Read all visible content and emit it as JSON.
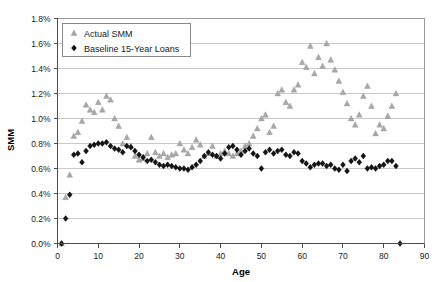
{
  "chart_data": {
    "type": "scatter",
    "title": "",
    "xlabel": "Age",
    "ylabel": "SMM",
    "xlim": [
      0,
      90
    ],
    "ylim": [
      0,
      1.8
    ],
    "grid": true,
    "legend_position": "top-left",
    "x_ticks": [
      "0",
      "10",
      "20",
      "30",
      "40",
      "50",
      "60",
      "70",
      "80",
      "90"
    ],
    "x_tick_values": [
      0,
      10,
      20,
      30,
      40,
      50,
      60,
      70,
      80,
      90
    ],
    "y_ticks": [
      "0.0%",
      "0.2%",
      "0.4%",
      "0.6%",
      "0.8%",
      "1.0%",
      "1.2%",
      "1.4%",
      "1.6%",
      "1.8%"
    ],
    "y_tick_values": [
      0.0,
      0.2,
      0.4,
      0.6,
      0.8,
      1.0,
      1.2,
      1.4,
      1.6,
      1.8
    ],
    "series": [
      {
        "name": "Actual SMM",
        "marker": "triangle",
        "color": "#a9a9a9",
        "x": [
          1,
          2,
          3,
          4,
          5,
          6,
          7,
          8,
          9,
          10,
          11,
          12,
          13,
          14,
          15,
          16,
          17,
          18,
          19,
          20,
          21,
          22,
          23,
          24,
          25,
          26,
          27,
          28,
          29,
          30,
          31,
          32,
          33,
          34,
          35,
          36,
          37,
          38,
          39,
          40,
          41,
          42,
          43,
          44,
          45,
          46,
          47,
          48,
          49,
          50,
          51,
          52,
          53,
          54,
          55,
          56,
          57,
          58,
          59,
          60,
          61,
          62,
          63,
          64,
          65,
          66,
          67,
          68,
          69,
          70,
          71,
          72,
          73,
          74,
          75,
          76,
          77,
          78,
          79,
          80,
          81,
          82,
          83
        ],
        "y": [
          0.0,
          0.37,
          0.55,
          0.86,
          0.89,
          0.98,
          1.11,
          1.07,
          1.05,
          1.13,
          1.07,
          1.18,
          1.15,
          1.0,
          0.94,
          0.8,
          0.85,
          0.78,
          0.7,
          0.67,
          0.68,
          0.72,
          0.85,
          0.73,
          0.7,
          0.72,
          0.69,
          0.71,
          0.72,
          0.8,
          0.75,
          0.72,
          0.77,
          0.83,
          0.79,
          0.7,
          0.72,
          0.78,
          0.7,
          0.72,
          0.74,
          0.72,
          0.7,
          0.72,
          0.74,
          0.78,
          0.8,
          0.86,
          0.92,
          1.0,
          1.03,
          0.89,
          0.94,
          1.2,
          1.23,
          1.13,
          1.1,
          1.23,
          1.27,
          1.45,
          1.41,
          1.58,
          1.36,
          1.49,
          1.42,
          1.6,
          1.47,
          1.39,
          1.3,
          1.21,
          1.12,
          1.0,
          0.95,
          1.03,
          1.18,
          1.26,
          1.1,
          0.88,
          0.95,
          0.92,
          1.02,
          1.1,
          1.2
        ]
      },
      {
        "name": "Baseline 15-Year Loans",
        "marker": "diamond",
        "color": "#141414",
        "x": [
          1,
          2,
          3,
          4,
          5,
          6,
          7,
          8,
          9,
          10,
          11,
          12,
          13,
          14,
          15,
          16,
          17,
          18,
          19,
          20,
          21,
          22,
          23,
          24,
          25,
          26,
          27,
          28,
          29,
          30,
          31,
          32,
          33,
          34,
          35,
          36,
          37,
          38,
          39,
          40,
          41,
          42,
          43,
          44,
          45,
          46,
          47,
          48,
          49,
          50,
          51,
          52,
          53,
          54,
          55,
          56,
          57,
          58,
          59,
          60,
          61,
          62,
          63,
          64,
          65,
          66,
          67,
          68,
          69,
          70,
          71,
          72,
          73,
          74,
          75,
          76,
          77,
          78,
          79,
          80,
          81,
          82,
          83,
          84
        ],
        "y": [
          0.0,
          0.2,
          0.39,
          0.71,
          0.72,
          0.65,
          0.74,
          0.78,
          0.79,
          0.8,
          0.8,
          0.81,
          0.78,
          0.76,
          0.75,
          0.73,
          0.78,
          0.77,
          0.74,
          0.71,
          0.69,
          0.66,
          0.67,
          0.65,
          0.63,
          0.62,
          0.63,
          0.62,
          0.61,
          0.6,
          0.6,
          0.59,
          0.61,
          0.63,
          0.66,
          0.7,
          0.73,
          0.71,
          0.7,
          0.68,
          0.72,
          0.77,
          0.78,
          0.75,
          0.71,
          0.74,
          0.76,
          0.72,
          0.7,
          0.6,
          0.73,
          0.75,
          0.72,
          0.74,
          0.75,
          0.71,
          0.7,
          0.73,
          0.72,
          0.66,
          0.64,
          0.61,
          0.63,
          0.64,
          0.64,
          0.62,
          0.63,
          0.6,
          0.59,
          0.63,
          0.58,
          0.66,
          0.68,
          0.65,
          0.7,
          0.6,
          0.61,
          0.6,
          0.62,
          0.63,
          0.66,
          0.66,
          0.62,
          0.0
        ]
      }
    ]
  },
  "legend": {
    "items": [
      {
        "label": "Actual SMM",
        "marker": "triangle"
      },
      {
        "label": "Baseline 15-Year Loans",
        "marker": "diamond"
      }
    ]
  },
  "axes": {
    "y_title": "SMM",
    "x_title": "Age"
  },
  "colors": {
    "actual": "#a9a9a9",
    "baseline": "#141414",
    "grid": "#c9c9c9",
    "axis": "#4d4d4d",
    "background": "#ffffff"
  }
}
